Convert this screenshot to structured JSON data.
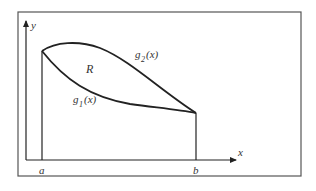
{
  "diagram": {
    "axes": {
      "x_label": "x",
      "y_label": "y"
    },
    "points": {
      "a": "a",
      "b": "b"
    },
    "curves": {
      "upper": {
        "name": "g",
        "subscript": "2",
        "arg": "(x)"
      },
      "lower": {
        "name": "g",
        "subscript": "1",
        "arg": "(x)"
      }
    },
    "region_label": "R",
    "colors": {
      "stroke": "#222222",
      "frame": "#555555",
      "text": "#333333"
    }
  }
}
